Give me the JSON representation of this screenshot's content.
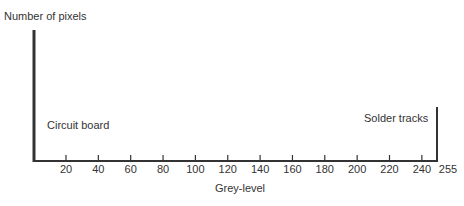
{
  "chart_data": {
    "type": "bar",
    "title": "",
    "xlabel": "Grey-level",
    "ylabel": "Number of pixels",
    "xlim": [
      0,
      255
    ],
    "x_ticks": [
      20,
      40,
      60,
      80,
      100,
      120,
      140,
      160,
      180,
      200,
      220,
      240
    ],
    "x_end_label": "255",
    "grid": false,
    "legend": null,
    "series": [
      {
        "name": "Histogram",
        "bars": [
          {
            "x": 0,
            "height_relative": 1.0,
            "label": "Circuit board"
          },
          {
            "x": 248,
            "height_relative": 0.41,
            "label": "Solder tracks"
          }
        ]
      }
    ],
    "annotations": [
      {
        "text": "Circuit board",
        "near_x": 0
      },
      {
        "text": "Solder tracks",
        "near_x": 248
      }
    ]
  },
  "labels": {
    "ylabel": "Number of pixels",
    "xlabel": "Grey-level",
    "circuit": "Circuit board",
    "solder": "Solder tracks",
    "end": "255",
    "ticks": [
      "20",
      "40",
      "60",
      "80",
      "100",
      "120",
      "140",
      "160",
      "180",
      "200",
      "220",
      "240"
    ]
  }
}
